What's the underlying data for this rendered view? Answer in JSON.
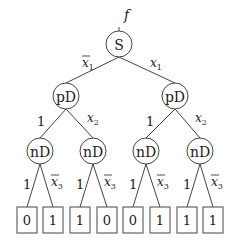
{
  "diagram": {
    "output_label": "f",
    "root": {
      "label": "S",
      "cx": 119,
      "cy": 44
    },
    "level1": [
      {
        "label": "pD",
        "cx": 66,
        "cy": 96,
        "edge_label": "x1",
        "edge_negated": true
      },
      {
        "label": "pD",
        "cx": 175,
        "cy": 96,
        "edge_label": "x1",
        "edge_negated": false
      }
    ],
    "level2": [
      {
        "label": "nD",
        "cx": 40,
        "cy": 151,
        "parent": 0,
        "edge_label": "1"
      },
      {
        "label": "nD",
        "cx": 93,
        "cy": 151,
        "parent": 0,
        "edge_label": "x2"
      },
      {
        "label": "nD",
        "cx": 146,
        "cy": 151,
        "parent": 1,
        "edge_label": "1"
      },
      {
        "label": "nD",
        "cx": 200,
        "cy": 151,
        "parent": 1,
        "edge_label": "x2"
      }
    ],
    "leaves": [
      {
        "value": "0",
        "cx": 27,
        "parent": 0,
        "edge_label": "1"
      },
      {
        "value": "1",
        "cx": 53,
        "parent": 0,
        "edge_label": "x3",
        "edge_negated": true
      },
      {
        "value": "1",
        "cx": 80,
        "parent": 1,
        "edge_label": "1"
      },
      {
        "value": "0",
        "cx": 107,
        "parent": 1,
        "edge_label": "x3",
        "edge_negated": true
      },
      {
        "value": "0",
        "cx": 133,
        "parent": 2,
        "edge_label": "1"
      },
      {
        "value": "1",
        "cx": 160,
        "parent": 2,
        "edge_label": "x3",
        "edge_negated": true
      },
      {
        "value": "1",
        "cx": 187,
        "parent": 3,
        "edge_label": "1"
      },
      {
        "value": "1",
        "cx": 213,
        "parent": 3,
        "edge_label": "x3",
        "edge_negated": true
      }
    ],
    "labels": {
      "x1bar": "x",
      "x1bar_sub": "1",
      "x1": "x",
      "x1_sub": "1",
      "one": "1",
      "x2": "x",
      "x2_sub": "2",
      "x3bar": "x",
      "x3bar_sub": "3"
    }
  }
}
